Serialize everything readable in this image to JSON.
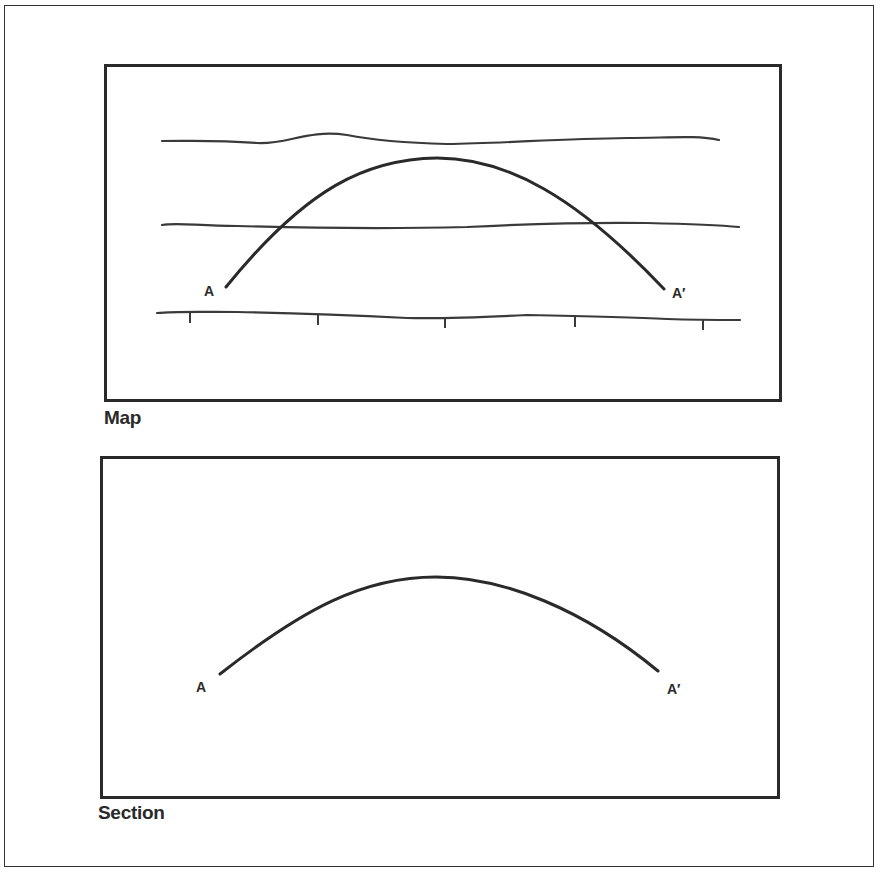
{
  "figure": {
    "map_panel": {
      "caption": "Map",
      "start_label": "A",
      "end_label": "A′",
      "contour_lines": 3,
      "tick_marks": 5
    },
    "section_panel": {
      "caption": "Section",
      "start_label": "A",
      "end_label": "A′"
    },
    "colors": {
      "ink": "#2a2a2a",
      "background": "#ffffff"
    }
  }
}
